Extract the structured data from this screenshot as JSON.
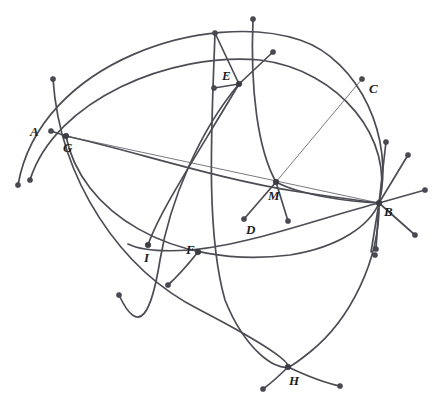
{
  "figure": {
    "canvas": {
      "width": 439,
      "height": 411,
      "background": "#ffffff"
    },
    "style": {
      "arc_stroke": "#4c4c55",
      "thin_line_stroke": "#55555e",
      "dot_fill": "#4a4a52",
      "label_color": "#1d1d22",
      "arc_stroke_width": 1.7,
      "thin_stroke_width": 0.8
    },
    "labels": [
      {
        "name": "A",
        "text": "A",
        "x": 30,
        "y": 136
      },
      {
        "name": "G",
        "text": "G",
        "x": 63,
        "y": 152
      },
      {
        "name": "E",
        "text": "E",
        "x": 222,
        "y": 80
      },
      {
        "name": "C",
        "text": "C",
        "x": 369,
        "y": 93
      },
      {
        "name": "M",
        "text": "M",
        "x": 268,
        "y": 200
      },
      {
        "name": "B",
        "text": "B",
        "x": 384,
        "y": 216
      },
      {
        "name": "D",
        "text": "D",
        "x": 246,
        "y": 234
      },
      {
        "name": "I",
        "text": "I",
        "x": 144,
        "y": 262
      },
      {
        "name": "F",
        "text": "F",
        "x": 186,
        "y": 254
      },
      {
        "name": "H",
        "text": "H",
        "x": 289,
        "y": 385
      }
    ],
    "vertices": [
      {
        "name": "G",
        "x": 66,
        "y": 136
      },
      {
        "name": "E",
        "x": 239,
        "y": 84
      },
      {
        "name": "M",
        "x": 276,
        "y": 182
      },
      {
        "name": "B",
        "x": 379,
        "y": 203
      },
      {
        "name": "I",
        "x": 148,
        "y": 245
      },
      {
        "name": "F",
        "x": 198,
        "y": 252
      },
      {
        "name": "H",
        "x": 288,
        "y": 367
      }
    ],
    "endpoint_dots": [
      {
        "name": "dot-A",
        "x": 51,
        "y": 131
      },
      {
        "name": "dot-C",
        "x": 362,
        "y": 79
      },
      {
        "name": "dot-D",
        "x": 244,
        "y": 219
      },
      {
        "name": "dot-G-up",
        "x": 53,
        "y": 79
      },
      {
        "name": "dot-G-lower-left",
        "x": 18,
        "y": 185
      },
      {
        "name": "dot-G-lower-left-2",
        "x": 30,
        "y": 180
      },
      {
        "name": "dot-E-up-left",
        "x": 215,
        "y": 33
      },
      {
        "name": "dot-E-up",
        "x": 253,
        "y": 19
      },
      {
        "name": "dot-E-up-right",
        "x": 273,
        "y": 52
      },
      {
        "name": "dot-E-left",
        "x": 214,
        "y": 88
      },
      {
        "name": "dot-M-right",
        "x": 288,
        "y": 221
      },
      {
        "name": "dot-B-up",
        "x": 386,
        "y": 142
      },
      {
        "name": "dot-B-up-right",
        "x": 408,
        "y": 155
      },
      {
        "name": "dot-B-right",
        "x": 425,
        "y": 190
      },
      {
        "name": "dot-B-low-right",
        "x": 415,
        "y": 235
      },
      {
        "name": "dot-B-down",
        "x": 376,
        "y": 249
      },
      {
        "name": "dot-B-down-left",
        "x": 375,
        "y": 255
      },
      {
        "name": "dot-I-tail",
        "x": 119,
        "y": 295
      },
      {
        "name": "dot-F-tail",
        "x": 168,
        "y": 285
      },
      {
        "name": "dot-H-left",
        "x": 263,
        "y": 389
      },
      {
        "name": "dot-H-right",
        "x": 340,
        "y": 386
      }
    ],
    "arcs": [
      {
        "name": "arc-outer-top",
        "d": "M 18,185 C 40,60 210,10 300,40 C 360,60 395,140 379,203"
      },
      {
        "name": "arc-G-to-B-upper",
        "d": "M 30,180 C 55,100 170,52 260,60 C 340,70 395,140 379,203"
      },
      {
        "name": "arc-G-lens-lower",
        "d": "M 66,136 C 80,210 170,270 290,255 C 340,247 370,225 379,203"
      },
      {
        "name": "arc-G-big-lower",
        "d": "M 53,79 C 60,180 120,270 200,310 C 250,336 290,360 288,367"
      },
      {
        "name": "arc-E-down-left",
        "d": "M 239,84 C 200,130 170,200 160,260 C 152,310 140,340 119,295"
      },
      {
        "name": "arc-E-through-M-B",
        "d": "M 253,19 C 250,90 258,150 276,182 C 300,195 350,202 379,203"
      },
      {
        "name": "arc-E-long-down",
        "d": "M 215,33 C 212,120 205,230 225,300 C 245,350 275,370 288,367"
      },
      {
        "name": "arc-B-to-H",
        "d": "M 379,203 C 380,260 350,320 310,352 C 295,364 290,367 288,367"
      },
      {
        "name": "arc-H-right-tail",
        "d": "M 288,367 C 305,375 325,383 340,386"
      },
      {
        "name": "arc-H-left-tail",
        "d": "M 288,367 C 280,375 270,384 263,389"
      },
      {
        "name": "arc-mid-lens",
        "d": "M 66,136 C 130,150 220,180 300,192 C 340,198 368,202 379,203"
      },
      {
        "name": "arc-F-tail",
        "d": "M 198,252 C 190,262 178,276 168,285"
      },
      {
        "name": "arc-I-through",
        "d": "M 148,245 C 160,210 200,150 239,84"
      },
      {
        "name": "arc-B-left-sweep",
        "d": "M 379,203 C 330,215 250,245 190,250 C 160,252 140,250 128,244"
      }
    ],
    "thin_lines": [
      {
        "name": "line-G-to-B",
        "x1": 66,
        "y1": 136,
        "x2": 379,
        "y2": 203
      },
      {
        "name": "line-M-to-C",
        "x1": 276,
        "y1": 182,
        "x2": 362,
        "y2": 79
      }
    ],
    "rays": [
      {
        "name": "ray-M-to-D",
        "x1": 276,
        "y1": 182,
        "x2": 244,
        "y2": 219
      },
      {
        "name": "ray-M-to-dot-right",
        "x1": 276,
        "y1": 182,
        "x2": 288,
        "y2": 221
      },
      {
        "name": "ray-E-to-up-left",
        "x1": 239,
        "y1": 84,
        "x2": 215,
        "y2": 33
      },
      {
        "name": "ray-E-to-up-right",
        "x1": 239,
        "y1": 84,
        "x2": 273,
        "y2": 52
      },
      {
        "name": "ray-E-to-left",
        "x1": 239,
        "y1": 84,
        "x2": 214,
        "y2": 88
      },
      {
        "name": "ray-B-to-up",
        "x1": 379,
        "y1": 203,
        "x2": 386,
        "y2": 142
      },
      {
        "name": "ray-B-to-up-right",
        "x1": 379,
        "y1": 203,
        "x2": 408,
        "y2": 155
      },
      {
        "name": "ray-B-to-right",
        "x1": 379,
        "y1": 203,
        "x2": 425,
        "y2": 190
      },
      {
        "name": "ray-B-to-low-right",
        "x1": 379,
        "y1": 203,
        "x2": 415,
        "y2": 235
      },
      {
        "name": "ray-B-to-down",
        "x1": 379,
        "y1": 203,
        "x2": 376,
        "y2": 249
      },
      {
        "name": "ray-B-to-down-left",
        "x1": 379,
        "y1": 203,
        "x2": 371,
        "y2": 252
      },
      {
        "name": "ray-G-to-A",
        "x1": 66,
        "y1": 136,
        "x2": 51,
        "y2": 131
      }
    ]
  }
}
